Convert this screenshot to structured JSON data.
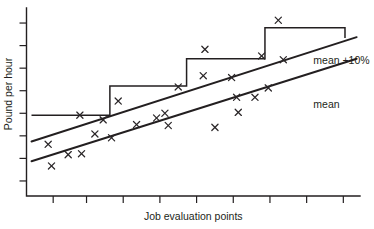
{
  "chart_data": {
    "type": "scatter",
    "title": "",
    "subtitle": "",
    "xlabel": "Job evaluation points",
    "ylabel": "Pound per hour",
    "grid": false,
    "legend_position": "right-inline",
    "xlim": [
      0,
      100
    ],
    "ylim": [
      0,
      100
    ],
    "x_ticks": [
      8,
      18,
      29,
      40,
      51,
      62,
      73,
      84,
      95
    ],
    "x_tick_labels": [
      "",
      "",
      "",
      "",
      "",
      "",
      "",
      "",
      ""
    ],
    "y_ticks": [
      8,
      20,
      32,
      44,
      56,
      68,
      80,
      92
    ],
    "y_tick_labels": [
      "",
      "",
      "",
      "",
      "",
      "",
      "",
      ""
    ],
    "annotations": [
      {
        "text": "mean +10%",
        "x": 86,
        "y": 70
      },
      {
        "text": "mean",
        "x": 86,
        "y": 47
      }
    ],
    "series": [
      {
        "name": "mean +10%",
        "type": "line",
        "style": "solid",
        "points": [
          {
            "x": 1.5,
            "y": 29.0
          },
          {
            "x": 99.0,
            "y": 84.5
          }
        ]
      },
      {
        "name": "mean",
        "type": "line",
        "style": "solid",
        "points": [
          {
            "x": 1.5,
            "y": 18.5
          },
          {
            "x": 99.0,
            "y": 73.0
          }
        ]
      },
      {
        "name": "pay grade structure",
        "type": "step",
        "style": "solid",
        "points": [
          {
            "x": 1.5,
            "y": 43.0
          },
          {
            "x": 25.0,
            "y": 43.0
          },
          {
            "x": 25.0,
            "y": 58.5
          },
          {
            "x": 48.0,
            "y": 58.5
          },
          {
            "x": 48.0,
            "y": 73.0
          },
          {
            "x": 71.5,
            "y": 73.0
          },
          {
            "x": 71.5,
            "y": 89.5
          },
          {
            "x": 95.5,
            "y": 89.5
          },
          {
            "x": 95.5,
            "y": 84.0
          }
        ]
      },
      {
        "name": "observed jobs",
        "type": "scatter",
        "marker": "x",
        "points": [
          {
            "x": 6.5,
            "y": 27.5
          },
          {
            "x": 7.5,
            "y": 16.0
          },
          {
            "x": 12.5,
            "y": 22.0
          },
          {
            "x": 16.5,
            "y": 22.5
          },
          {
            "x": 16.0,
            "y": 43.0
          },
          {
            "x": 20.5,
            "y": 33.0
          },
          {
            "x": 23.0,
            "y": 40.5
          },
          {
            "x": 25.5,
            "y": 31.0
          },
          {
            "x": 27.5,
            "y": 50.5
          },
          {
            "x": 33.0,
            "y": 38.0
          },
          {
            "x": 39.0,
            "y": 41.5
          },
          {
            "x": 41.5,
            "y": 44.0
          },
          {
            "x": 42.5,
            "y": 37.5
          },
          {
            "x": 45.5,
            "y": 58.0
          },
          {
            "x": 53.0,
            "y": 64.0
          },
          {
            "x": 53.5,
            "y": 78.0
          },
          {
            "x": 56.5,
            "y": 36.5
          },
          {
            "x": 61.5,
            "y": 63.0
          },
          {
            "x": 63.5,
            "y": 44.5
          },
          {
            "x": 63.0,
            "y": 52.5
          },
          {
            "x": 68.5,
            "y": 52.5
          },
          {
            "x": 72.5,
            "y": 57.5
          },
          {
            "x": 70.5,
            "y": 74.5
          },
          {
            "x": 77.0,
            "y": 72.5
          },
          {
            "x": 75.5,
            "y": 93.5
          }
        ]
      }
    ]
  }
}
